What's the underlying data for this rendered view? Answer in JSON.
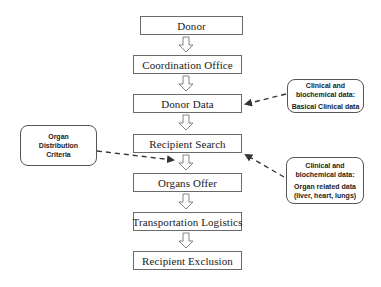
{
  "diagram": {
    "type": "flowchart",
    "steps": [
      {
        "label": "Donor"
      },
      {
        "label": "Coordination Office"
      },
      {
        "label": "Donor Data"
      },
      {
        "label": "Recipient Search"
      },
      {
        "label": "Organs Offer"
      },
      {
        "label": "Transportation Logistics"
      },
      {
        "label": "Recipient Exclusion"
      }
    ],
    "callouts": {
      "distribution": {
        "line1": "Organ",
        "line2": "Distribution",
        "line3": "Criteria",
        "points_to": "Recipient Search → Organs Offer"
      },
      "basic_clinical": {
        "line1": "Clinical and",
        "line2": "biochemical data:",
        "line3": "Basical Clinical data",
        "points_to": "Donor Data"
      },
      "organ_related": {
        "line1": "Clinical and",
        "line2": "biochemical data:",
        "line3": "Organ related data",
        "line4": "(liver, heart, lungs)",
        "points_to": "Recipient Search"
      }
    },
    "colors": {
      "border": "#6a6a6a",
      "text": "#1a1a1a",
      "connector": "#333333"
    }
  }
}
